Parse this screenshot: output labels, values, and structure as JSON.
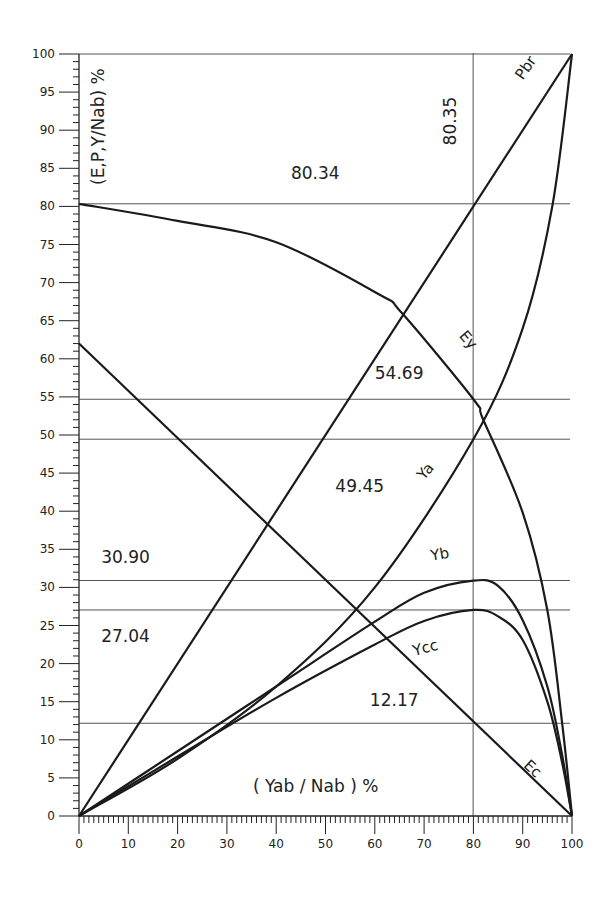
{
  "chart_data": {
    "type": "line",
    "title": "",
    "xlabel": "( Yab / Nab ) %",
    "ylabel": "(E,P,Y/Nab) %",
    "xlim": [
      0,
      100
    ],
    "ylim": [
      0,
      100
    ],
    "x_ticks": [
      0,
      10,
      20,
      30,
      40,
      50,
      60,
      70,
      80,
      90,
      100
    ],
    "y_ticks": [
      0,
      5,
      10,
      15,
      20,
      25,
      30,
      35,
      40,
      45,
      50,
      55,
      60,
      65,
      70,
      75,
      80,
      85,
      90,
      95,
      100
    ],
    "grid": false,
    "legend": "none (inline curve labels)",
    "series": [
      {
        "name": "Pbr",
        "x": [
          0,
          100
        ],
        "y": [
          0,
          100
        ]
      },
      {
        "name": "Ey",
        "x": [
          0,
          20,
          40,
          61,
          65.5,
          80,
          82,
          90,
          95,
          98,
          100
        ],
        "y": [
          80.34,
          78.1,
          75.3,
          68.4,
          66,
          54.69,
          52,
          39.8,
          27,
          12.2,
          0
        ]
      },
      {
        "name": "Ya",
        "x": [
          0,
          20,
          40,
          60,
          80,
          90,
          96,
          100
        ],
        "y": [
          0,
          7.5,
          17,
          30,
          49.45,
          64,
          80,
          100
        ]
      },
      {
        "name": "Yb",
        "x": [
          0,
          20,
          40,
          60,
          70,
          80,
          85,
          90,
          95,
          98,
          100
        ],
        "y": [
          0,
          8.5,
          17,
          25.5,
          29.3,
          30.9,
          30.2,
          25.7,
          17,
          8,
          0
        ]
      },
      {
        "name": "Ycc",
        "x": [
          0,
          20,
          40,
          60,
          70,
          80,
          85,
          90,
          95,
          98,
          100
        ],
        "y": [
          0,
          7.8,
          15.5,
          22.5,
          25.6,
          27.04,
          26.2,
          23.1,
          15,
          7,
          0
        ]
      },
      {
        "name": "Ec",
        "x": [
          0,
          100
        ],
        "y": [
          62,
          0
        ]
      }
    ],
    "reference_lines": {
      "horizontal": [
        {
          "y": 80.34,
          "label": "80.34"
        },
        {
          "y": 54.69,
          "label": "54.69"
        },
        {
          "y": 49.45,
          "label": "49.45"
        },
        {
          "y": 30.9,
          "label": "30.90"
        },
        {
          "y": 27.04,
          "label": "27.04"
        },
        {
          "y": 12.17,
          "label": "12.17"
        },
        {
          "y": 100,
          "label": ""
        }
      ],
      "vertical": [
        {
          "x": 80.35,
          "label": "80.35"
        }
      ]
    },
    "annotations": [
      {
        "text": "80.34",
        "x": 43,
        "y": 83.6
      },
      {
        "text": "54.69",
        "x": 60,
        "y": 57.4
      },
      {
        "text": "49.45",
        "x": 52,
        "y": 42.5
      },
      {
        "text": "30.90",
        "x": 4.5,
        "y": 33.2
      },
      {
        "text": "27.04",
        "x": 4.5,
        "y": 22.8
      },
      {
        "text": "12.17",
        "x": 59,
        "y": 14.5
      },
      {
        "text": "80.35",
        "x": 76.5,
        "y": 88,
        "rotate": -90
      },
      {
        "text": "Pbr",
        "x": 90,
        "y": 96.5,
        "rotate": -55
      },
      {
        "text": "Ey",
        "x": 77,
        "y": 63,
        "rotate": 50
      },
      {
        "text": "Ya",
        "x": 70,
        "y": 44,
        "rotate": -50
      },
      {
        "text": "Yb",
        "x": 71.5,
        "y": 33.5,
        "rotate": -10
      },
      {
        "text": "Ycc",
        "x": 68,
        "y": 21,
        "rotate": -15
      },
      {
        "text": "Ec",
        "x": 90,
        "y": 6.5,
        "rotate": 42
      }
    ]
  }
}
